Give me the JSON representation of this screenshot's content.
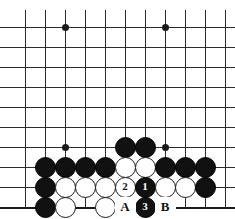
{
  "diagram": {
    "type": "go-board-diagram",
    "board": {
      "columns": 11,
      "rows": 10,
      "cell_size": 20,
      "origin_x": 25,
      "origin_y": 27,
      "line_color": "#2a2a2a",
      "background_color": "#ffffff",
      "bottom_edge_is_board_edge": true
    },
    "star_points": [
      {
        "col": 2,
        "row": 0
      },
      {
        "col": 7,
        "row": 0
      },
      {
        "col": 2,
        "row": 6
      },
      {
        "col": 7,
        "row": 6
      }
    ],
    "stones": [
      {
        "col": 5,
        "row": 6,
        "color": "black",
        "label": ""
      },
      {
        "col": 6,
        "row": 6,
        "color": "black",
        "label": ""
      },
      {
        "col": 1,
        "row": 7,
        "color": "black",
        "label": ""
      },
      {
        "col": 2,
        "row": 7,
        "color": "black",
        "label": ""
      },
      {
        "col": 3,
        "row": 7,
        "color": "black",
        "label": ""
      },
      {
        "col": 4,
        "row": 7,
        "color": "black",
        "label": ""
      },
      {
        "col": 5,
        "row": 7,
        "color": "white",
        "label": ""
      },
      {
        "col": 6,
        "row": 7,
        "color": "white",
        "label": ""
      },
      {
        "col": 7,
        "row": 7,
        "color": "black",
        "label": ""
      },
      {
        "col": 8,
        "row": 7,
        "color": "black",
        "label": ""
      },
      {
        "col": 9,
        "row": 7,
        "color": "black",
        "label": ""
      },
      {
        "col": 1,
        "row": 8,
        "color": "black",
        "label": ""
      },
      {
        "col": 2,
        "row": 8,
        "color": "white",
        "label": ""
      },
      {
        "col": 3,
        "row": 8,
        "color": "white",
        "label": ""
      },
      {
        "col": 4,
        "row": 8,
        "color": "white",
        "label": ""
      },
      {
        "col": 5,
        "row": 8,
        "color": "white",
        "label": "2"
      },
      {
        "col": 6,
        "row": 8,
        "color": "black",
        "label": "1"
      },
      {
        "col": 7,
        "row": 8,
        "color": "white",
        "label": ""
      },
      {
        "col": 8,
        "row": 8,
        "color": "white",
        "label": ""
      },
      {
        "col": 9,
        "row": 8,
        "color": "black",
        "label": ""
      },
      {
        "col": 1,
        "row": 9,
        "color": "black",
        "label": ""
      },
      {
        "col": 2,
        "row": 9,
        "color": "white",
        "label": ""
      },
      {
        "col": 4,
        "row": 9,
        "color": "white",
        "label": ""
      },
      {
        "col": 6,
        "row": 9,
        "color": "black",
        "label": "3"
      }
    ],
    "point_labels": [
      {
        "col": 5,
        "row": 9,
        "text": "A"
      },
      {
        "col": 7,
        "row": 9,
        "text": "B"
      }
    ]
  }
}
